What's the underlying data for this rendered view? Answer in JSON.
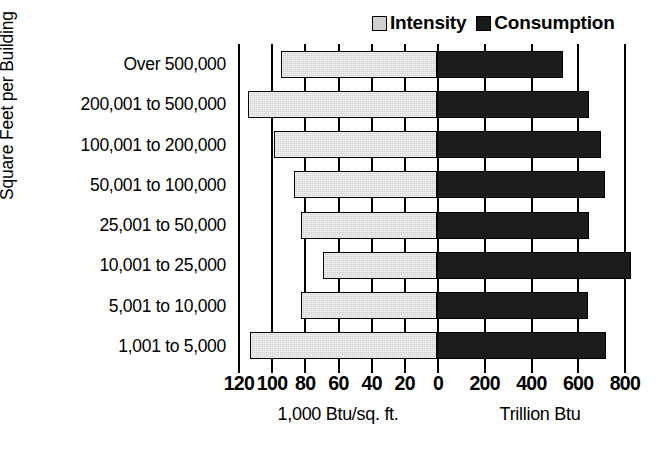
{
  "chart_data": {
    "type": "bar",
    "orientation": "horizontal-diverging",
    "title": "",
    "categories": [
      "Over 500,000",
      "200,001 to 500,000",
      "100,001 to 200,000",
      "50,001 to 100,000",
      "25,001 to 50,000",
      "10,001 to 25,000",
      "5,001 to 10,000",
      "1,001 to 5,000"
    ],
    "series": [
      {
        "name": "Intensity",
        "side": "left",
        "units": "1,000 Btu/sq. ft.",
        "color": "#cfcfcf",
        "values": [
          94,
          114,
          98,
          86,
          82,
          69,
          82,
          113
        ]
      },
      {
        "name": "Consumption",
        "side": "right",
        "units": "Trillion Btu",
        "color": "#1c1c1c",
        "values": [
          540,
          650,
          700,
          720,
          650,
          830,
          645,
          725
        ]
      }
    ],
    "ylabel": "Square Feet per Building",
    "xlabel_left": "1,000 Btu/sq. ft.",
    "xlabel_right": "Trillion Btu",
    "left_axis": {
      "label": "1,000 Btu/sq. ft.",
      "ticks": [
        120,
        100,
        80,
        60,
        40,
        20,
        0
      ],
      "tick_labels": [
        "120",
        "100",
        "80",
        "60",
        "40",
        "20",
        "0"
      ],
      "range": [
        120,
        0
      ],
      "direction": "reversed"
    },
    "right_axis": {
      "label": "Trillion Btu",
      "ticks": [
        0,
        200,
        400,
        600,
        800
      ],
      "tick_labels": [
        "0",
        "200",
        "400",
        "600",
        "800"
      ],
      "range": [
        0,
        800
      ]
    },
    "grid": true,
    "legend_position": "top-right"
  },
  "legend": {
    "entries": [
      {
        "label": "Intensity",
        "color": "#cfcfcf"
      },
      {
        "label": "Consumption",
        "color": "#1c1c1c"
      }
    ]
  },
  "axes": {
    "y_title": "Square Feet per Building",
    "x_caption_left": "1,000 Btu/sq. ft.",
    "x_caption_right": "Trillion Btu"
  }
}
